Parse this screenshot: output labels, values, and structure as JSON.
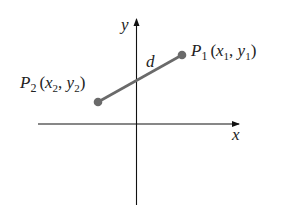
{
  "diagram": {
    "type": "coordinate-plane-distance",
    "axes": {
      "x_label": "x",
      "y_label": "y"
    },
    "points": [
      {
        "id": "P1",
        "name": "P",
        "subscript": "1",
        "coords": "(x1, y1)",
        "cx": "x",
        "cxs": "1",
        "cy": "y",
        "cys": "1"
      },
      {
        "id": "P2",
        "name": "P",
        "subscript": "2",
        "coords": "(x2, y2)",
        "cx": "x",
        "cxs": "2",
        "cy": "y",
        "cys": "2"
      }
    ],
    "segment_label": "d",
    "colors": {
      "axis": "#111111",
      "segment": "#666666",
      "point": "#666666",
      "text": "#222222"
    }
  }
}
